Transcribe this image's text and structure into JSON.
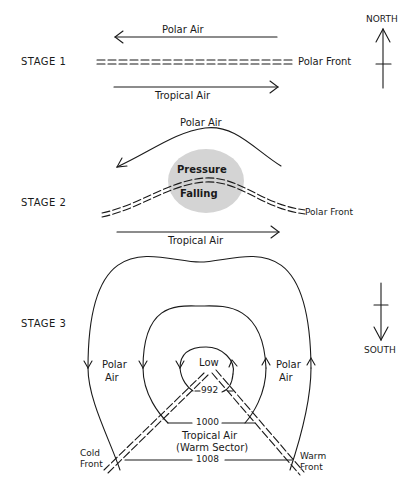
{
  "stages": [
    {
      "label": "STAGE 1",
      "polar_air": "Polar Air",
      "tropical_air": "Tropical Air",
      "front": "Polar Front"
    },
    {
      "label": "STAGE 2",
      "polar_air": "Polar Air",
      "tropical_air": "Tropical Air",
      "front": "Polar Front",
      "pressure_line1": "Pressure",
      "pressure_line2": "Falling"
    },
    {
      "label": "STAGE 3",
      "polar_air_left_1": "Polar",
      "polar_air_left_2": "Air",
      "polar_air_right_1": "Polar",
      "polar_air_right_2": "Air",
      "low": "Low",
      "isobars": [
        "992",
        "1000",
        "1008"
      ],
      "warm_sector_1": "Tropical Air",
      "warm_sector_2": "(Warm Sector)",
      "cold_front_1": "Cold",
      "cold_front_2": "Front",
      "warm_front_1": "Warm",
      "warm_front_2": "Front"
    }
  ],
  "compass": {
    "north": "NORTH",
    "south": "SOUTH"
  },
  "colors": {
    "ink": "#1a1a1a",
    "pressure_area": "#d4d4d4"
  }
}
